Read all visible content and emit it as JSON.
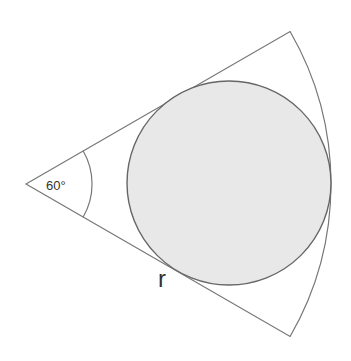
{
  "diagram": {
    "angle_label": "60°",
    "radius_label": "r",
    "colors": {
      "stroke": "#777777",
      "circle_fill": "#e8e8e8",
      "circle_stroke": "#666666",
      "text": "#333333",
      "background": "#ffffff"
    },
    "sector": {
      "apex": [
        26,
        184
      ],
      "radius": 305,
      "angle_deg": 60,
      "top_corner": [
        290,
        31
      ],
      "bottom_corner": [
        290,
        337
      ]
    },
    "inscribed_circle": {
      "center": [
        229,
        183
      ],
      "radius": 102
    },
    "angle_arc": {
      "radius": 66
    }
  }
}
